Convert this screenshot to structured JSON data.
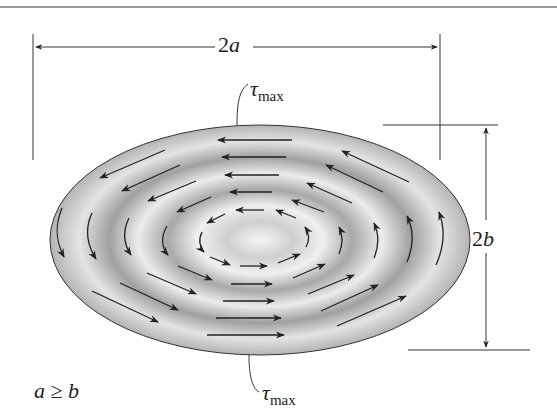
{
  "figure": {
    "dimension_width": {
      "prefix": "2",
      "variable": "a"
    },
    "dimension_height": {
      "prefix": "2",
      "variable": "b"
    },
    "tau_top": {
      "symbol": "τ",
      "subscript": "max"
    },
    "tau_bottom": {
      "symbol": "τ",
      "subscript": "max"
    },
    "condition": {
      "left": "a",
      "relation": "≥",
      "right": "b"
    }
  },
  "colors": {
    "line": "#333333",
    "shade_dark": "#8c8c8c",
    "shade_light": "#f2f2f2",
    "top_rule": "#9a9a9a"
  }
}
